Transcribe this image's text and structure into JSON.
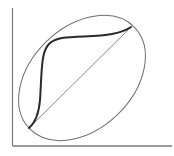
{
  "diagram": {
    "type": "line-diagram",
    "colors": {
      "background": "#ffffff",
      "axis": "#7a7a7a",
      "ellipse": "#6e6e6e",
      "diagonal": "#7a7a7a",
      "curve": "#2a2a2a"
    },
    "axes": {
      "y_axis": {
        "x": 12.5,
        "y1": 8,
        "y2": 146
      },
      "x_axis": {
        "y": 146,
        "x1": 12.5,
        "x2": 172
      }
    },
    "ellipse": {
      "cx": 82,
      "cy": 78,
      "rx": 73,
      "ry": 51,
      "rotation_deg": -44
    },
    "diagonal_line": {
      "x1": 29,
      "y1": 128,
      "x2": 131,
      "y2": 27
    },
    "s_curve": {
      "description": "thick sigmoid curve from lower-left to upper-right intersection",
      "path": "M29,128 C36,122 39,112 40,100 C41,88 41,70 43,58 C45,46 50,40 62,38 C78,36 98,37 112,34 C122,32 127,30 131,27"
    },
    "intersections": [
      {
        "x": 29,
        "y": 128
      },
      {
        "x": 131,
        "y": 27
      }
    ]
  }
}
